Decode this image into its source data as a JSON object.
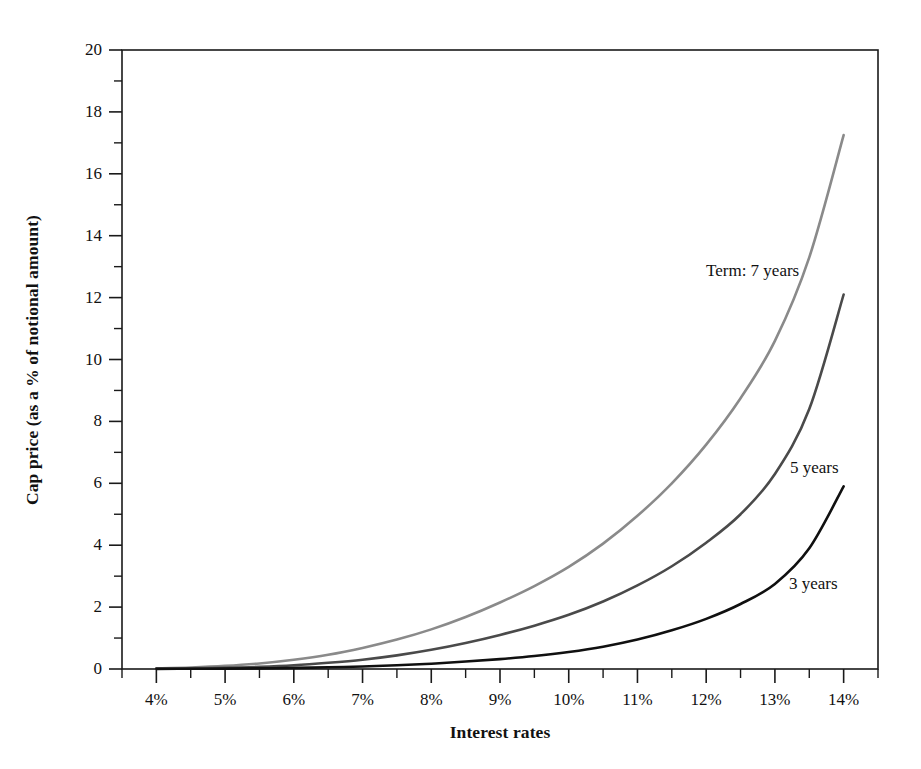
{
  "chart_data": {
    "type": "line",
    "title": "",
    "xlabel": "Interest rates",
    "ylabel": "Cap price (as a % of notional amount)",
    "xlim": [
      3.5,
      14.5
    ],
    "ylim": [
      0,
      20
    ],
    "grid": false,
    "legend_position": "inline-labels",
    "x_tick_labels": [
      "4%",
      "5%",
      "6%",
      "7%",
      "8%",
      "9%",
      "10%",
      "11%",
      "12%",
      "13%",
      "14%"
    ],
    "x_tick_values": [
      4,
      5,
      6,
      7,
      8,
      9,
      10,
      11,
      12,
      13,
      14
    ],
    "x_minor_tick_values": [
      3.5,
      4.5,
      5.5,
      6.5,
      7.5,
      8.5,
      9.5,
      10.5,
      11.5,
      12.5,
      13.5,
      14.5
    ],
    "y_tick_labels": [
      "0",
      "2",
      "4",
      "6",
      "8",
      "10",
      "12",
      "14",
      "16",
      "18",
      "20"
    ],
    "y_tick_values": [
      0,
      2,
      4,
      6,
      8,
      10,
      12,
      14,
      16,
      18,
      20
    ],
    "y_minor_tick_values": [
      1,
      3,
      5,
      7,
      9,
      11,
      13,
      15,
      17,
      19
    ],
    "x": [
      4,
      4.5,
      5,
      5.5,
      6,
      6.5,
      7,
      7.5,
      8,
      8.5,
      9,
      9.5,
      10,
      10.5,
      11,
      11.5,
      12,
      12.5,
      13,
      13.5,
      14
    ],
    "series": [
      {
        "name": "Term: 7 years",
        "label": "Term: 7 years",
        "color": "#8a8a8a",
        "width": 2.6,
        "values": [
          0.02,
          0.05,
          0.1,
          0.18,
          0.3,
          0.46,
          0.68,
          0.95,
          1.28,
          1.68,
          2.15,
          2.68,
          3.3,
          4.05,
          4.95,
          6.0,
          7.25,
          8.75,
          10.6,
          13.3,
          17.25
        ]
      },
      {
        "name": "5 years",
        "label": "5 years",
        "color": "#4a4a4a",
        "width": 2.6,
        "values": [
          0.01,
          0.02,
          0.04,
          0.07,
          0.12,
          0.2,
          0.3,
          0.44,
          0.62,
          0.84,
          1.1,
          1.4,
          1.75,
          2.18,
          2.7,
          3.32,
          4.08,
          5.0,
          6.3,
          8.4,
          12.1
        ]
      },
      {
        "name": "3 years",
        "label": "3 years",
        "color": "#101010",
        "width": 2.6,
        "values": [
          0.005,
          0.008,
          0.012,
          0.02,
          0.035,
          0.055,
          0.08,
          0.12,
          0.17,
          0.24,
          0.32,
          0.42,
          0.55,
          0.72,
          0.95,
          1.25,
          1.62,
          2.1,
          2.75,
          3.9,
          5.9
        ]
      }
    ],
    "annotations": [
      {
        "text": "Term: 7 years",
        "x_px": 706,
        "y_px": 262,
        "series": "Term: 7 years"
      },
      {
        "text": "5 years",
        "x_px": 790,
        "y_px": 459,
        "series": "5 years"
      },
      {
        "text": "3 years",
        "x_px": 789,
        "y_px": 575,
        "series": "3 years"
      }
    ]
  },
  "axes": {
    "frame_color": "#1a1a1a",
    "tick_color": "#1a1a1a"
  }
}
